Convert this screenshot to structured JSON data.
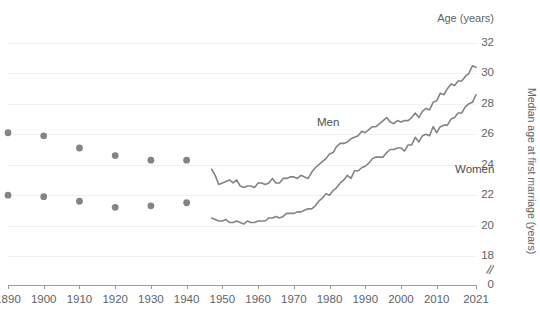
{
  "chart_data": {
    "type": "line",
    "title": "",
    "subtitle": "",
    "xlabel": "",
    "ylabel": "Median age at first marriage (years)",
    "axis_top_label": "Age (years)",
    "ylim": [
      18,
      32
    ],
    "y_break_at_zero": true,
    "y_zero_label": "0",
    "yticks": [
      32,
      30,
      28,
      26,
      24,
      22,
      20,
      18
    ],
    "ytick_labels": [
      "32",
      "30",
      "28",
      "26",
      "24",
      "22",
      "20",
      "18"
    ],
    "xlim": [
      1890,
      2021
    ],
    "xticks": [
      1890,
      1900,
      1910,
      1920,
      1930,
      1940,
      1950,
      1960,
      1970,
      1980,
      1990,
      2000,
      2010,
      2021
    ],
    "xtick_labels": [
      "1890",
      "1900",
      "1910",
      "1920",
      "1930",
      "1940",
      "1950",
      "1960",
      "1970",
      "1980",
      "1990",
      "2000",
      "2010",
      "2021"
    ],
    "grid": true,
    "grid_axis": "y",
    "legend": "inline-annotations",
    "series_color": "#808589",
    "series": [
      {
        "name": "Men",
        "label": "Men",
        "marker_points": {
          "x": [
            1890,
            1900,
            1910,
            1920,
            1930,
            1940
          ],
          "y": [
            26.1,
            25.9,
            25.1,
            24.6,
            24.3,
            24.3
          ]
        },
        "line_points": {
          "x": [
            1947,
            1948,
            1949,
            1950,
            1951,
            1952,
            1953,
            1954,
            1955,
            1956,
            1957,
            1958,
            1959,
            1960,
            1961,
            1962,
            1963,
            1964,
            1965,
            1966,
            1967,
            1968,
            1969,
            1970,
            1971,
            1972,
            1973,
            1974,
            1975,
            1976,
            1977,
            1978,
            1979,
            1980,
            1981,
            1982,
            1983,
            1984,
            1985,
            1986,
            1987,
            1988,
            1989,
            1990,
            1991,
            1992,
            1993,
            1994,
            1995,
            1996,
            1997,
            1998,
            1999,
            2000,
            2001,
            2002,
            2003,
            2004,
            2005,
            2006,
            2007,
            2008,
            2009,
            2010,
            2011,
            2012,
            2013,
            2014,
            2015,
            2016,
            2017,
            2018,
            2019,
            2020,
            2021
          ],
          "y": [
            23.7,
            23.3,
            22.7,
            22.8,
            22.9,
            23.0,
            22.8,
            23.0,
            22.6,
            22.5,
            22.6,
            22.6,
            22.5,
            22.8,
            22.8,
            22.7,
            22.8,
            23.1,
            22.8,
            22.8,
            23.1,
            23.1,
            23.2,
            23.2,
            23.1,
            23.3,
            23.2,
            23.1,
            23.5,
            23.8,
            24.0,
            24.2,
            24.4,
            24.7,
            24.8,
            25.2,
            25.4,
            25.4,
            25.5,
            25.7,
            25.8,
            25.9,
            26.2,
            26.1,
            26.3,
            26.5,
            26.5,
            26.7,
            26.9,
            27.1,
            26.8,
            26.7,
            26.9,
            26.8,
            26.9,
            26.9,
            27.1,
            27.4,
            27.1,
            27.5,
            27.7,
            27.6,
            28.1,
            28.2,
            28.7,
            28.6,
            29.0,
            29.3,
            29.2,
            29.5,
            29.5,
            29.8,
            30.0,
            30.5,
            30.4
          ]
        }
      },
      {
        "name": "Women",
        "label": "Women",
        "marker_points": {
          "x": [
            1890,
            1900,
            1910,
            1920,
            1930,
            1940
          ],
          "y": [
            22.0,
            21.9,
            21.6,
            21.2,
            21.3,
            21.5
          ]
        },
        "line_points": {
          "x": [
            1947,
            1948,
            1949,
            1950,
            1951,
            1952,
            1953,
            1954,
            1955,
            1956,
            1957,
            1958,
            1959,
            1960,
            1961,
            1962,
            1963,
            1964,
            1965,
            1966,
            1967,
            1968,
            1969,
            1970,
            1971,
            1972,
            1973,
            1974,
            1975,
            1976,
            1977,
            1978,
            1979,
            1980,
            1981,
            1982,
            1983,
            1984,
            1985,
            1986,
            1987,
            1988,
            1989,
            1990,
            1991,
            1992,
            1993,
            1994,
            1995,
            1996,
            1997,
            1998,
            1999,
            2000,
            2001,
            2002,
            2003,
            2004,
            2005,
            2006,
            2007,
            2008,
            2009,
            2010,
            2011,
            2012,
            2013,
            2014,
            2015,
            2016,
            2017,
            2018,
            2019,
            2020,
            2021
          ],
          "y": [
            20.5,
            20.4,
            20.3,
            20.3,
            20.4,
            20.2,
            20.2,
            20.3,
            20.2,
            20.1,
            20.3,
            20.2,
            20.2,
            20.3,
            20.3,
            20.3,
            20.5,
            20.5,
            20.6,
            20.5,
            20.6,
            20.8,
            20.8,
            20.8,
            20.9,
            20.9,
            21.0,
            21.1,
            21.1,
            21.3,
            21.6,
            21.8,
            22.1,
            22.0,
            22.3,
            22.5,
            22.8,
            23.0,
            23.3,
            23.1,
            23.6,
            23.6,
            23.8,
            23.9,
            24.1,
            24.4,
            24.5,
            24.5,
            24.5,
            24.8,
            25.0,
            25.0,
            25.1,
            25.1,
            24.9,
            25.3,
            25.3,
            25.8,
            25.5,
            25.9,
            26.0,
            25.9,
            26.5,
            26.1,
            26.5,
            26.6,
            26.6,
            27.0,
            27.1,
            27.4,
            27.4,
            27.8,
            28.0,
            28.1,
            28.6
          ]
        }
      }
    ]
  },
  "annotations": {
    "men_label": "Men",
    "women_label": "Women",
    "y_axis_title": "Median age at first marriage (years)",
    "age_years_label": "Age (years)",
    "zero_label": "0"
  }
}
